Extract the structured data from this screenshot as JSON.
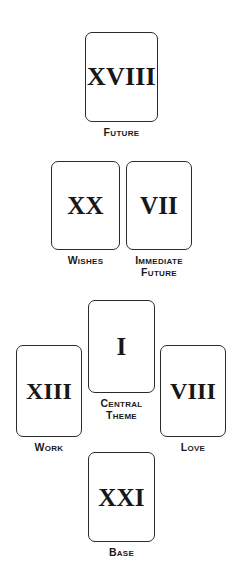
{
  "diagram": {
    "background_color": "#ffffff",
    "card_border_color": "#2b2b2b",
    "numeral_color": "#171717",
    "caption_color": "#1a1a1a"
  },
  "cards": [
    {
      "id": "future",
      "numeral": "XVIII",
      "caption_lines": [
        "Future"
      ],
      "position": "top"
    },
    {
      "id": "wishes",
      "numeral": "XX",
      "caption_lines": [
        "Wishes"
      ],
      "position": "second-row-left"
    },
    {
      "id": "immediate-future",
      "numeral": "VII",
      "caption_lines": [
        "Immediate",
        "Future"
      ],
      "position": "second-row-right"
    },
    {
      "id": "work",
      "numeral": "XIII",
      "caption_lines": [
        "Work"
      ],
      "position": "third-row-left"
    },
    {
      "id": "central-theme",
      "numeral": "I",
      "caption_lines": [
        "Central",
        "Theme"
      ],
      "position": "third-row-center"
    },
    {
      "id": "love",
      "numeral": "VIII",
      "caption_lines": [
        "Love"
      ],
      "position": "third-row-right"
    },
    {
      "id": "base",
      "numeral": "XXI",
      "caption_lines": [
        "Base"
      ],
      "position": "bottom"
    }
  ]
}
